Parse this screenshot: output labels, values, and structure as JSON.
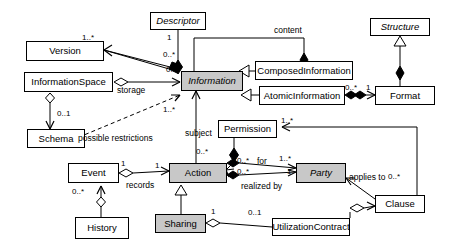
{
  "diagram": {
    "type": "uml-class-diagram",
    "palette": {
      "abstract_fill": "#c8c8c8",
      "concrete_fill": "#ffffff",
      "line": "#000000"
    },
    "classes": [
      {
        "id": "descriptor",
        "label": "Descriptor",
        "x": 150,
        "y": 12,
        "w": 56,
        "h": 18,
        "abstract": true,
        "filled": false
      },
      {
        "id": "structure",
        "label": "Structure",
        "x": 370,
        "y": 18,
        "w": 60,
        "h": 18,
        "abstract": true,
        "filled": false
      },
      {
        "id": "version",
        "label": "Version",
        "x": 26,
        "y": 41,
        "w": 78,
        "h": 20,
        "abstract": false,
        "filled": false
      },
      {
        "id": "composedinformation",
        "label": "ComposedInformation",
        "x": 255,
        "y": 61,
        "w": 98,
        "h": 19,
        "abstract": false,
        "filled": false
      },
      {
        "id": "information",
        "label": "Information",
        "x": 181,
        "y": 71,
        "w": 62,
        "h": 20,
        "abstract": true,
        "filled": true
      },
      {
        "id": "informationspace",
        "label": "InformationSpace",
        "x": 24,
        "y": 72,
        "w": 89,
        "h": 20,
        "abstract": false,
        "filled": false
      },
      {
        "id": "atomicinformation",
        "label": "AtomicInformation",
        "x": 259,
        "y": 86,
        "w": 86,
        "h": 19,
        "abstract": false,
        "filled": false
      },
      {
        "id": "format",
        "label": "Format",
        "x": 375,
        "y": 86,
        "w": 60,
        "h": 19,
        "abstract": false,
        "filled": false
      },
      {
        "id": "permission",
        "label": "Permission",
        "x": 218,
        "y": 120,
        "w": 59,
        "h": 18,
        "abstract": false,
        "filled": false
      },
      {
        "id": "schema",
        "label": "Schema",
        "x": 27,
        "y": 129,
        "w": 58,
        "h": 19,
        "abstract": false,
        "filled": false
      },
      {
        "id": "event",
        "label": "Event",
        "x": 68,
        "y": 163,
        "w": 51,
        "h": 20,
        "abstract": false,
        "filled": false
      },
      {
        "id": "action",
        "label": "Action",
        "x": 169,
        "y": 163,
        "w": 58,
        "h": 20,
        "abstract": false,
        "filled": true
      },
      {
        "id": "party",
        "label": "Party",
        "x": 296,
        "y": 163,
        "w": 50,
        "h": 20,
        "abstract": true,
        "filled": true
      },
      {
        "id": "clause",
        "label": "Clause",
        "x": 375,
        "y": 195,
        "w": 50,
        "h": 18,
        "abstract": false,
        "filled": false
      },
      {
        "id": "sharing",
        "label": "Sharing",
        "x": 155,
        "y": 214,
        "w": 51,
        "h": 19,
        "abstract": false,
        "filled": true
      },
      {
        "id": "utilizationcontract",
        "label": "UtilizationContract",
        "x": 272,
        "y": 218,
        "w": 78,
        "h": 18,
        "abstract": false,
        "filled": false
      },
      {
        "id": "history",
        "label": "History",
        "x": 75,
        "y": 217,
        "w": 54,
        "h": 22,
        "abstract": false,
        "filled": false
      }
    ],
    "role_labels": [
      {
        "id": "content",
        "text": "content",
        "x": 274,
        "y": 26
      },
      {
        "id": "storage",
        "text": "storage",
        "x": 117,
        "y": 86
      },
      {
        "id": "possible-restrictions",
        "text": "possible restrictions",
        "x": 78,
        "y": 134
      },
      {
        "id": "subject",
        "text": "subject",
        "x": 185,
        "y": 129
      },
      {
        "id": "records",
        "text": "records",
        "x": 126,
        "y": 181
      },
      {
        "id": "for",
        "text": "for",
        "x": 257,
        "y": 157
      },
      {
        "id": "realized-by",
        "text": "realized by",
        "x": 241,
        "y": 182
      },
      {
        "id": "applies-to",
        "text": "applies to",
        "x": 349,
        "y": 173
      }
    ],
    "multiplicities": [
      {
        "id": "m-descriptor-1",
        "text": "1",
        "x": 167,
        "y": 34
      },
      {
        "id": "m-version-1star",
        "text": "1..*",
        "x": 82,
        "y": 34
      },
      {
        "id": "m-descriptor-0star",
        "text": "0..*",
        "x": 163,
        "y": 51
      },
      {
        "id": "m-information-0star",
        "text": "0..",
        "x": 166,
        "y": 66
      },
      {
        "id": "m-atomic-0star",
        "text": "0..*",
        "x": 345,
        "y": 84
      },
      {
        "id": "m-format-1",
        "text": "1",
        "x": 366,
        "y": 84
      },
      {
        "id": "m-infospace-01",
        "text": "0..1",
        "x": 57,
        "y": 110
      },
      {
        "id": "m-information-1star",
        "text": "1..*",
        "x": 163,
        "y": 106
      },
      {
        "id": "m-permission-1star",
        "text": "1..*",
        "x": 281,
        "y": 117
      },
      {
        "id": "m-action-0star",
        "text": "0..*",
        "x": 196,
        "y": 148
      },
      {
        "id": "m-event-1",
        "text": "1",
        "x": 121,
        "y": 160
      },
      {
        "id": "m-action-1",
        "text": "1",
        "x": 155,
        "y": 162
      },
      {
        "id": "m-for-0star",
        "text": "0..*",
        "x": 237,
        "y": 157
      },
      {
        "id": "m-party-1star",
        "text": "1..*",
        "x": 279,
        "y": 155
      },
      {
        "id": "m-realized-0star",
        "text": "0..*",
        "x": 237,
        "y": 168
      },
      {
        "id": "m-party-1",
        "text": "1",
        "x": 287,
        "y": 168
      },
      {
        "id": "m-clause-0star",
        "text": "0..*",
        "x": 388,
        "y": 173
      },
      {
        "id": "m-history-0star",
        "text": "0..*",
        "x": 72,
        "y": 188
      },
      {
        "id": "m-sharing-1",
        "text": "1",
        "x": 211,
        "y": 208
      },
      {
        "id": "m-contract-01",
        "text": "0..1",
        "x": 248,
        "y": 209
      }
    ]
  }
}
